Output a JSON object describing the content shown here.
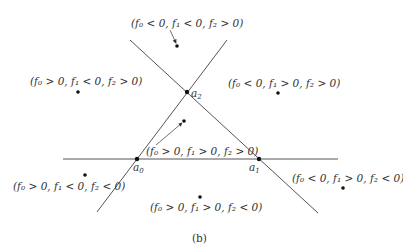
{
  "caption": "(b)",
  "points": {
    "a0": {
      "label": "a",
      "sub": "0"
    },
    "a1": {
      "label": "a",
      "sub": "1"
    },
    "a2": {
      "label": "a",
      "sub": "2"
    }
  },
  "regions": [
    {
      "id": "top",
      "text": "(f₀ < 0, f₁ < 0, f₂ > 0)"
    },
    {
      "id": "upper-left",
      "text": "(f₀ > 0, f₁ < 0, f₂ > 0)"
    },
    {
      "id": "upper-right",
      "text": "(f₀ < 0, f₁ > 0, f₂ > 0)"
    },
    {
      "id": "center",
      "text": "(f₀ > 0, f₁ > 0, f₂ > 0)"
    },
    {
      "id": "lower-left",
      "text": "(f₀ > 0, f₁ < 0, f₂ < 0)"
    },
    {
      "id": "lower-right",
      "text": "(f₀ < 0, f₁ > 0, f₂ < 0)"
    },
    {
      "id": "bottom",
      "text": "(f₀ > 0, f₁ > 0, f₂ < 0)"
    }
  ],
  "colors": {
    "line": "#555555",
    "dot": "#111111",
    "text": "#333333"
  }
}
